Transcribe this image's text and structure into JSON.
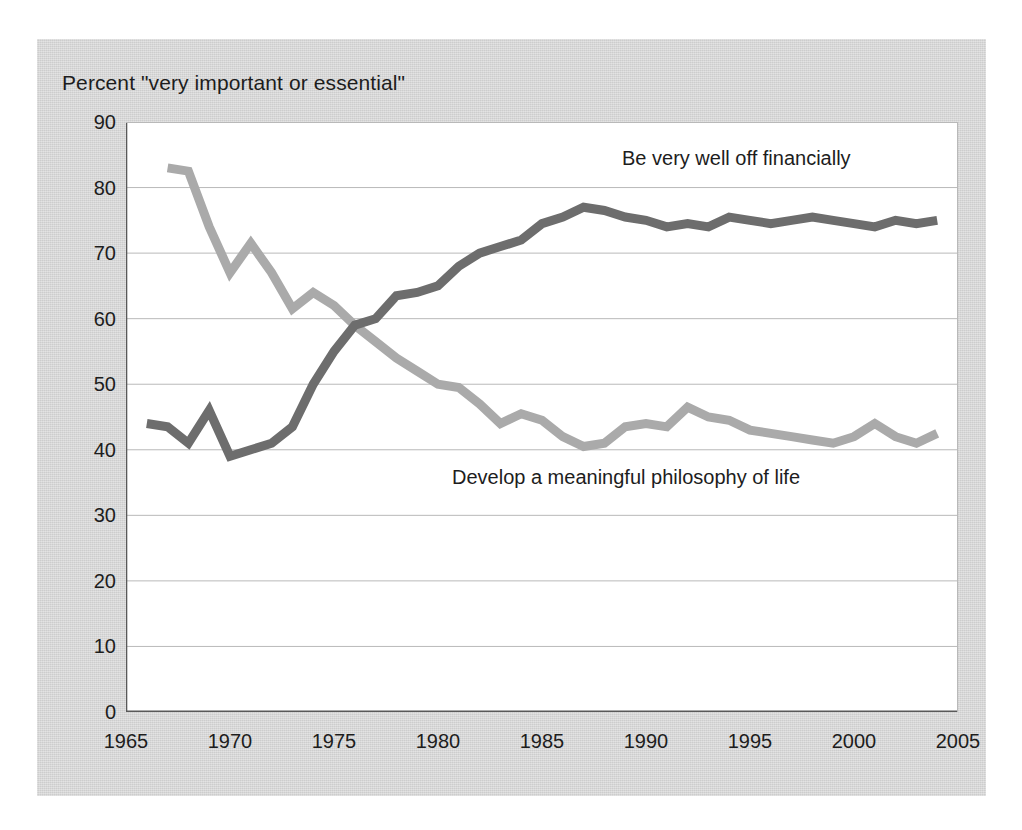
{
  "chart_data": {
    "type": "line",
    "title": "Percent \"very important or essential\"",
    "xlabel": "",
    "ylabel": "",
    "xlim": [
      1965,
      2005
    ],
    "ylim": [
      0,
      90
    ],
    "grid": true,
    "legend_position": "inline-annotation",
    "xticks": [
      1965,
      1970,
      1975,
      1980,
      1985,
      1990,
      1995,
      2000,
      2005
    ],
    "yticks": [
      0,
      10,
      20,
      30,
      40,
      50,
      60,
      70,
      80,
      90
    ],
    "series": [
      {
        "name": "Be very well off financially",
        "color": "#6d6d6d",
        "label_x": 1993.5,
        "label_y": 83,
        "x": [
          1966,
          1967,
          1968,
          1969,
          1970,
          1971,
          1972,
          1973,
          1974,
          1975,
          1976,
          1977,
          1978,
          1979,
          1980,
          1981,
          1982,
          1983,
          1984,
          1985,
          1986,
          1987,
          1988,
          1989,
          1990,
          1991,
          1992,
          1993,
          1994,
          1995,
          1996,
          1997,
          1998,
          1999,
          2000,
          2001,
          2002,
          2003,
          2004
        ],
        "values": [
          44,
          43.5,
          41,
          46,
          39,
          40,
          41,
          43.5,
          50,
          55,
          59,
          60,
          63.5,
          64,
          65,
          68,
          70,
          71,
          72,
          74.5,
          75.5,
          77,
          76.5,
          75.5,
          75,
          74,
          74.5,
          74,
          75.5,
          75,
          74.5,
          75,
          75.5,
          75,
          74.5,
          74,
          75,
          74.5,
          75
        ]
      },
      {
        "name": "Develop a meaningful philosophy of life",
        "color": "#aaaaaa",
        "label_x": 1981,
        "label_y": 35,
        "x": [
          1967,
          1968,
          1969,
          1970,
          1971,
          1972,
          1973,
          1974,
          1975,
          1976,
          1977,
          1978,
          1979,
          1980,
          1981,
          1982,
          1983,
          1984,
          1985,
          1986,
          1987,
          1988,
          1989,
          1990,
          1991,
          1992,
          1993,
          1994,
          1995,
          1996,
          1997,
          1998,
          1999,
          2000,
          2001,
          2002,
          2003,
          2004
        ],
        "values": [
          83,
          82.5,
          74,
          67,
          71.5,
          67,
          61.5,
          64,
          62,
          59,
          56.5,
          54,
          52,
          50,
          49.5,
          47,
          44,
          45.5,
          44.5,
          42,
          40.5,
          41,
          43.5,
          44,
          43.5,
          46.5,
          45,
          44.5,
          43,
          42.5,
          42,
          41.5,
          41,
          42,
          44,
          42,
          41,
          42.5
        ]
      }
    ]
  },
  "axes": {
    "y_labels": [
      "90",
      "80",
      "70",
      "60",
      "50",
      "40",
      "30",
      "20",
      "10",
      "0"
    ],
    "x_labels": [
      "1965",
      "1970",
      "1975",
      "1980",
      "1985",
      "1990",
      "1995",
      "2000",
      "2005"
    ]
  },
  "colors": {
    "card_background": "#d4d4d4",
    "plot_background": "#ffffff",
    "grid": "#b9b9b9",
    "axis": "#595959",
    "text": "#1d1d1d",
    "series_dark": "#6d6d6d",
    "series_light": "#aaaaaa"
  }
}
